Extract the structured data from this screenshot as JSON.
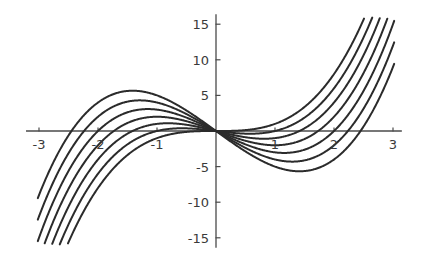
{
  "chart_data": {
    "type": "line",
    "title": "",
    "subtitle": "",
    "xlabel": "",
    "ylabel": "",
    "xlim": [
      -3.2,
      3.2
    ],
    "ylim": [
      -16,
      16
    ],
    "grid": false,
    "legend": "none",
    "background": "#ffffff",
    "curve_color": "#2b2b2b",
    "axis_color": "#4a4a4a",
    "x_ticks": [
      -3,
      -2,
      -1,
      1,
      2,
      3
    ],
    "x_tick_labels": [
      "-3",
      "-2",
      "-1",
      "1",
      "2",
      "3"
    ],
    "y_ticks": [
      -15,
      -10,
      -5,
      5,
      10,
      15
    ],
    "y_tick_labels": [
      "-15",
      "-10",
      "-5",
      "5",
      "10",
      "15"
    ],
    "function_family": "y = x^3 - a x",
    "series": [
      {
        "name": "a = 0",
        "a": 0,
        "x_domain": [
          -2.52,
          2.52
        ],
        "points": [
          [
            -2.52,
            -16.0
          ],
          [
            -2.2,
            -10.65
          ],
          [
            -1.8,
            -5.83
          ],
          [
            -1.4,
            -2.74
          ],
          [
            -1.0,
            -1.0
          ],
          [
            -0.6,
            -0.22
          ],
          [
            -0.2,
            -0.01
          ],
          [
            0,
            0
          ],
          [
            0.2,
            0.01
          ],
          [
            0.6,
            0.22
          ],
          [
            1.0,
            1.0
          ],
          [
            1.4,
            2.74
          ],
          [
            1.8,
            5.83
          ],
          [
            2.2,
            10.65
          ],
          [
            2.52,
            16.0
          ]
        ]
      },
      {
        "name": "a = 1",
        "a": 1,
        "x_domain": [
          -2.6,
          2.6
        ],
        "points": [
          [
            -2.6,
            -15.0
          ],
          [
            -2.2,
            -8.45
          ],
          [
            -1.8,
            -4.03
          ],
          [
            -1.4,
            -1.34
          ],
          [
            -1.0,
            0.0
          ],
          [
            -0.6,
            0.38
          ],
          [
            -0.2,
            0.19
          ],
          [
            0,
            0
          ],
          [
            0.2,
            -0.19
          ],
          [
            0.6,
            -0.38
          ],
          [
            1.0,
            0.0
          ],
          [
            1.4,
            1.34
          ],
          [
            1.8,
            4.03
          ],
          [
            2.2,
            8.45
          ],
          [
            2.6,
            15.0
          ]
        ]
      },
      {
        "name": "a = 2",
        "a": 2,
        "x_domain": [
          -2.72,
          2.72
        ],
        "points": [
          [
            -2.72,
            -14.7
          ],
          [
            -2.4,
            -9.02
          ],
          [
            -2.0,
            -4.0
          ],
          [
            -1.6,
            -0.9
          ],
          [
            -1.2,
            0.67
          ],
          [
            -0.8,
            1.09
          ],
          [
            -0.4,
            0.74
          ],
          [
            0,
            0
          ],
          [
            0.4,
            -0.74
          ],
          [
            0.8,
            -1.09
          ],
          [
            1.2,
            -0.67
          ],
          [
            1.6,
            0.9
          ],
          [
            2.0,
            4.0
          ],
          [
            2.4,
            9.02
          ],
          [
            2.72,
            14.7
          ]
        ]
      },
      {
        "name": "a = 3",
        "a": 3,
        "x_domain": [
          -2.85,
          2.85
        ],
        "points": [
          [
            -2.85,
            -14.0
          ],
          [
            -2.4,
            -6.62
          ],
          [
            -2.0,
            -2.0
          ],
          [
            -1.6,
            0.7
          ],
          [
            -1.2,
            1.87
          ],
          [
            -0.8,
            1.89
          ],
          [
            -0.4,
            1.14
          ],
          [
            0,
            0
          ],
          [
            0.4,
            -1.14
          ],
          [
            0.8,
            -1.89
          ],
          [
            1.2,
            -1.87
          ],
          [
            1.6,
            -0.7
          ],
          [
            2.0,
            2.0
          ],
          [
            2.4,
            6.62
          ],
          [
            2.85,
            14.0
          ]
        ]
      },
      {
        "name": "a = 4",
        "a": 4,
        "x_domain": [
          -3.0,
          3.0
        ],
        "points": [
          [
            -3.0,
            -15.0
          ],
          [
            -2.6,
            -6.98
          ],
          [
            -2.2,
            -1.85
          ],
          [
            -1.8,
            1.37
          ],
          [
            -1.4,
            2.86
          ],
          [
            -1.0,
            3.0
          ],
          [
            -0.6,
            2.18
          ],
          [
            -0.2,
            0.79
          ],
          [
            0,
            0
          ],
          [
            0.2,
            -0.79
          ],
          [
            0.6,
            -2.18
          ],
          [
            1.0,
            -3.0
          ],
          [
            1.4,
            -2.86
          ],
          [
            1.8,
            -1.37
          ],
          [
            2.2,
            1.85
          ],
          [
            2.6,
            6.98
          ],
          [
            3.0,
            15.0
          ]
        ]
      },
      {
        "name": "a = 5",
        "a": 5,
        "x_domain": [
          -3.0,
          3.0
        ],
        "points": [
          [
            -3.0,
            -12.0
          ],
          [
            -2.6,
            -4.58
          ],
          [
            -2.2,
            0.35
          ],
          [
            -1.8,
            3.17
          ],
          [
            -1.4,
            4.26
          ],
          [
            -1.0,
            4.0
          ],
          [
            -0.6,
            2.78
          ],
          [
            -0.2,
            0.99
          ],
          [
            0,
            0
          ],
          [
            0.2,
            -0.99
          ],
          [
            0.6,
            -2.78
          ],
          [
            1.0,
            -4.0
          ],
          [
            1.4,
            -4.26
          ],
          [
            1.8,
            -3.17
          ],
          [
            2.2,
            -0.35
          ],
          [
            2.6,
            4.58
          ],
          [
            3.0,
            12.0
          ]
        ]
      },
      {
        "name": "a = 6",
        "a": 6,
        "x_domain": [
          -3.0,
          3.0
        ],
        "points": [
          [
            -3.0,
            -9.0
          ],
          [
            -2.6,
            -2.02
          ],
          [
            -2.2,
            2.55
          ],
          [
            -1.8,
            4.97
          ],
          [
            -1.4,
            5.66
          ],
          [
            -1.0,
            5.0
          ],
          [
            -0.6,
            3.38
          ],
          [
            -0.2,
            1.19
          ],
          [
            0,
            0
          ],
          [
            0.2,
            -1.19
          ],
          [
            0.6,
            -3.38
          ],
          [
            1.0,
            -5.0
          ],
          [
            1.4,
            -5.66
          ],
          [
            1.8,
            -4.97
          ],
          [
            2.2,
            -2.55
          ],
          [
            2.6,
            2.02
          ],
          [
            3.0,
            9.0
          ]
        ]
      }
    ]
  },
  "axes": {
    "x_axis_name": "horizontal-axis",
    "y_axis_name": "vertical-axis"
  }
}
